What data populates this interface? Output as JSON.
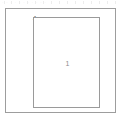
{
  "canvas": {
    "width": 122,
    "height": 121,
    "background_color": "#ffffff"
  },
  "header": {
    "strip_text": "· · · · · ·   · ·   · ·   ·",
    "tick_positions": [
      4,
      11,
      19,
      27,
      35,
      43,
      51,
      59,
      67,
      75,
      83,
      91,
      99,
      107,
      115
    ],
    "tick_color": "#ededed",
    "text_color": "#e6e6e6"
  },
  "shapes": {
    "outer_rect": {
      "name": "drawing-frame",
      "x": 5,
      "y": 8,
      "width": 111,
      "height": 105,
      "stroke_color": "#9d9d9d",
      "stroke_width": 1,
      "fill_color": "#ffffff"
    },
    "inner_rect": {
      "name": "inner-region",
      "x": 33,
      "y": 17,
      "width": 67,
      "height": 91,
      "stroke_color": "#9a9a9a",
      "stroke_width": 1,
      "fill_color": "#ffffff"
    }
  },
  "labels": {
    "corner_label": "A",
    "corner_label_color": "#5c5c5c",
    "center_label": "1",
    "center_label_color": "#8e8e8e"
  }
}
